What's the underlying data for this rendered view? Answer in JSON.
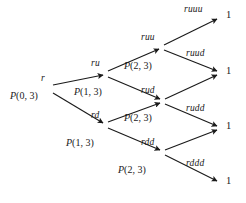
{
  "figure": {
    "type": "recombining-lattice-tree",
    "width": 246,
    "height": 203,
    "background": "#ffffff",
    "ink": "#1a1a1a"
  },
  "nodes": [
    {
      "id": "r",
      "label": "r",
      "prob": "P(0, 3)",
      "x": 45,
      "y": 88
    },
    {
      "id": "ru",
      "label": "ru",
      "prob": "P(1, 3)",
      "x": 105,
      "y": 73
    },
    {
      "id": "rd",
      "label": "rd",
      "prob": "P(1, 3)",
      "x": 105,
      "y": 125
    },
    {
      "id": "ruu",
      "label": "ruu",
      "prob": "P(2, 3)",
      "x": 161,
      "y": 47
    },
    {
      "id": "rud",
      "label": "rud",
      "prob": "P(2, 3)",
      "x": 162,
      "y": 101
    },
    {
      "id": "rdd",
      "label": "rdd",
      "prob": "P(2, 3)",
      "x": 162,
      "y": 152
    }
  ],
  "edges": [
    {
      "from": "r",
      "to": "ru",
      "label": ""
    },
    {
      "from": "r",
      "to": "rd",
      "label": ""
    },
    {
      "from": "ru",
      "to": "ruu",
      "label": ""
    },
    {
      "from": "ru",
      "to": "rud",
      "label": "rud"
    },
    {
      "from": "rd",
      "to": "rud",
      "label": ""
    },
    {
      "from": "rd",
      "to": "rdd",
      "label": "rdd"
    },
    {
      "from": "ruu",
      "to": "t1",
      "label": "ruuu"
    },
    {
      "from": "ruu",
      "to": "t2",
      "label": "ruud"
    },
    {
      "from": "rud",
      "to": "t2",
      "label": ""
    },
    {
      "from": "rud",
      "to": "t3",
      "label": "rudd"
    },
    {
      "from": "rdd",
      "to": "t3",
      "label": ""
    },
    {
      "from": "rdd",
      "to": "t4",
      "label": "rddd"
    }
  ],
  "terminals": [
    {
      "id": "t1",
      "path": "ruuu",
      "value": "1",
      "x": 219,
      "y": 17
    },
    {
      "id": "t2",
      "path": "ruud",
      "value": "1",
      "x": 219,
      "y": 73
    },
    {
      "id": "t3",
      "path": "rudd",
      "value": "1",
      "x": 219,
      "y": 128
    },
    {
      "id": "t4",
      "path": "rddd",
      "value": "1",
      "x": 219,
      "y": 183
    }
  ],
  "labels": {
    "root_name": "r",
    "root_prob": "P(0, 3)",
    "ru_name": "ru",
    "ru_prob": "P(1, 3)",
    "rd_name": "rd",
    "rd_prob": "P(1, 3)",
    "ruu_name": "ruu",
    "ruu_prob": "P(2, 3)",
    "rud_name": "rud",
    "rud_prob": "P(2, 3)",
    "rdd_name": "rdd",
    "rdd_prob": "P(2, 3)",
    "ruuu_name": "ruuu",
    "ruud_name": "ruud",
    "rudd_name": "rudd",
    "rddd_name": "rddd",
    "terminal_1": "1",
    "terminal_2": "1",
    "terminal_3": "1",
    "terminal_4": "1"
  }
}
